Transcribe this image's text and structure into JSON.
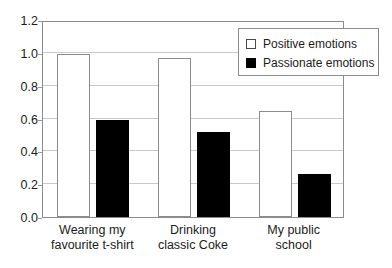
{
  "chart_data": {
    "type": "bar",
    "title": "",
    "subtitle": "",
    "xlabel": "",
    "ylabel": "",
    "categories": [
      "Wearing my\nfavourite t-shirt",
      "Drinking\nclassic Coke",
      "My public\nschool"
    ],
    "category_lines": [
      [
        "Wearing my",
        "favourite t-shirt"
      ],
      [
        "Drinking",
        "classic Coke"
      ],
      [
        "My public",
        "school"
      ]
    ],
    "series": [
      {
        "name": "Positive emotions",
        "values": [
          0.99,
          0.97,
          0.645
        ],
        "color": "#ffffff",
        "edge_color": "#8c8c8c"
      },
      {
        "name": "Passionate emotions",
        "values": [
          0.59,
          0.52,
          0.265
        ],
        "color": "#000000",
        "edge_color": "#000000"
      }
    ],
    "ylim": [
      0.0,
      1.2
    ],
    "yticks": [
      0.0,
      0.2,
      0.4,
      0.6,
      0.8,
      1.0,
      1.2
    ],
    "ytick_labels": [
      "0.0",
      "0.2",
      "0.4",
      "0.6",
      "0.8",
      "1.0",
      "1.2"
    ],
    "grid": true,
    "grid_axis": "y",
    "grid_color": "#c9c9c9",
    "legend_position": "top-right",
    "frame_color": "#8c8c8c",
    "background": "#ffffff"
  },
  "legend": {
    "entries": [
      {
        "label": "Positive emotions",
        "swatch": "open-square-swatch"
      },
      {
        "label": "Passionate emotions",
        "swatch": "filled-square-swatch"
      }
    ]
  },
  "axis": {
    "y_tick_labels": [
      "1.2",
      "1.0",
      "0.8",
      "0.6",
      "0.4",
      "0.2",
      "0.0"
    ]
  }
}
